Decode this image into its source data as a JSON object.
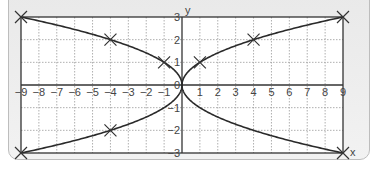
{
  "chart_data": {
    "type": "line",
    "title": "",
    "xlabel": "x",
    "ylabel": "y",
    "xlim": [
      -9,
      9
    ],
    "ylim": [
      -3,
      3
    ],
    "grid": true,
    "x_ticks": [
      "-9",
      "-8",
      "-7",
      "-6",
      "-5",
      "-4",
      "-3",
      "-2",
      "-1",
      "0",
      "1",
      "2",
      "3",
      "4",
      "5",
      "6",
      "7",
      "8",
      "9"
    ],
    "y_ticks": [
      "3",
      "2",
      "1",
      "0",
      "-1",
      "-2",
      "-3"
    ],
    "series": [
      {
        "name": "upper-right branch y=√x",
        "x": [
          0,
          1,
          4,
          9
        ],
        "y": [
          0,
          1,
          2,
          3
        ]
      },
      {
        "name": "lower-right branch y=-√x",
        "x": [
          0,
          1,
          4,
          9
        ],
        "y": [
          0,
          -1,
          -2,
          -3
        ]
      },
      {
        "name": "upper-left branch y=√(-x)",
        "x": [
          0,
          -1,
          -4,
          -9
        ],
        "y": [
          0,
          1,
          2,
          3
        ]
      },
      {
        "name": "lower-left branch y=-√(-x)",
        "x": [
          0,
          -1,
          -4,
          -9
        ],
        "y": [
          0,
          -1,
          -2,
          -3
        ]
      }
    ],
    "marked_points": [
      {
        "x": -9,
        "y": 3
      },
      {
        "x": -4,
        "y": 2
      },
      {
        "x": -1,
        "y": 1
      },
      {
        "x": 1,
        "y": 1
      },
      {
        "x": 4,
        "y": 2
      },
      {
        "x": 9,
        "y": 3
      },
      {
        "x": -9,
        "y": -3
      },
      {
        "x": -4,
        "y": -2
      },
      {
        "x": 9,
        "y": -3
      }
    ],
    "marker": "x",
    "colors": {
      "curve": "#2a2a2a",
      "grid": "#9a9a9a",
      "frame": "#333333"
    }
  },
  "labels": {
    "x_axis": "x",
    "y_axis": "y"
  }
}
